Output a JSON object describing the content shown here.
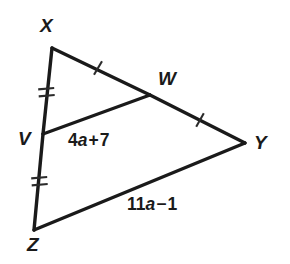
{
  "figure": {
    "kind": "triangle-midsegment-diagram",
    "background_color": "#ffffff",
    "line_color": "#1a1a1a",
    "tick_color": "#2b2b2b"
  },
  "vertices": [
    {
      "id": "X",
      "label": "X",
      "point": [
        52,
        48
      ],
      "label_pos": [
        40,
        16
      ]
    },
    {
      "id": "W",
      "label": "W",
      "point": [
        150,
        95
      ],
      "label_pos": [
        158,
        69
      ]
    },
    {
      "id": "Y",
      "label": "Y",
      "point": [
        245,
        143
      ],
      "label_pos": [
        254,
        133
      ]
    },
    {
      "id": "V",
      "label": "V",
      "point": [
        43,
        134
      ],
      "label_pos": [
        18,
        129
      ]
    },
    {
      "id": "Z",
      "label": "Z",
      "point": [
        34,
        230
      ],
      "label_pos": [
        27,
        235
      ]
    }
  ],
  "edges": [
    {
      "id": "XW",
      "from": "X",
      "to": "W",
      "ticks": 1
    },
    {
      "id": "WY",
      "from": "W",
      "to": "Y",
      "ticks": 1
    },
    {
      "id": "XV",
      "from": "X",
      "to": "V",
      "ticks": 2
    },
    {
      "id": "VZ",
      "from": "V",
      "to": "Z",
      "ticks": 2
    },
    {
      "id": "ZY",
      "from": "Z",
      "to": "Y",
      "ticks": 0
    },
    {
      "id": "VW",
      "from": "V",
      "to": "W",
      "ticks": 0
    }
  ],
  "tick_marks": [
    {
      "id": "tick-xw",
      "on_edge": "XW",
      "count": 1,
      "center": [
        98,
        68
      ]
    },
    {
      "id": "tick-wy",
      "on_edge": "WY",
      "count": 1,
      "center": [
        200,
        120
      ]
    },
    {
      "id": "tick-xv",
      "on_edge": "XV",
      "count": 2,
      "center": [
        47,
        92
      ]
    },
    {
      "id": "tick-vz",
      "on_edge": "VZ",
      "count": 2,
      "center": [
        40,
        181
      ]
    }
  ],
  "segment_labels": [
    {
      "id": "label-vw",
      "for_edge": "VW",
      "text": "4a + 7",
      "coefficient": "4",
      "variable": "a",
      "operator": "+",
      "constant": "7",
      "pos": [
        68,
        132
      ]
    },
    {
      "id": "label-zy",
      "for_edge": "ZY",
      "text": "11a − 1",
      "coefficient": "11",
      "variable": "a",
      "operator": "−",
      "constant": "1",
      "pos": [
        127,
        196
      ]
    }
  ]
}
